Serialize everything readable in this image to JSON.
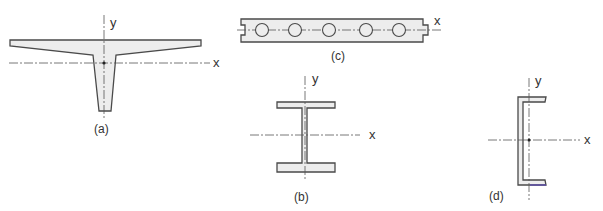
{
  "figures": [
    {
      "id": "a",
      "label": "(a)",
      "shape": "tee-beam with tapered flanges and tapered web",
      "axes": {
        "x": "x",
        "y": "y"
      }
    },
    {
      "id": "b",
      "label": "(b)",
      "shape": "I-beam (wide-flange section)",
      "axes": {
        "x": "x",
        "y": "y"
      }
    },
    {
      "id": "c",
      "label": "(c)",
      "shape": "hollow-core plank with five circular voids",
      "axes": {
        "x": "x"
      },
      "hole_count": 5
    },
    {
      "id": "d",
      "label": "(d)",
      "shape": "channel (C) section",
      "axes": {
        "x": "x",
        "y": "y"
      }
    }
  ],
  "colors": {
    "fill": "#ededed",
    "stroke": "#4a4a4a",
    "accent_edge": "#5a4ab0"
  }
}
